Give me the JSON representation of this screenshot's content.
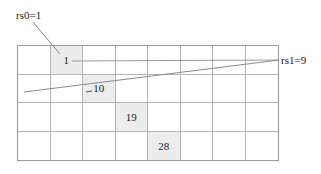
{
  "labels": {
    "rs0": "rs0=1",
    "rs1": "rs1=9"
  },
  "grid": {
    "columns": 8,
    "rows": 4,
    "highlight_color": "#ececec",
    "line_color": "#b5b5b5",
    "highlighted_cells": [
      {
        "row": 0,
        "col": 1,
        "value": "1"
      },
      {
        "row": 1,
        "col": 2,
        "value": "10"
      },
      {
        "row": 2,
        "col": 3,
        "value": "19"
      },
      {
        "row": 3,
        "col": 4,
        "value": "28"
      }
    ]
  }
}
